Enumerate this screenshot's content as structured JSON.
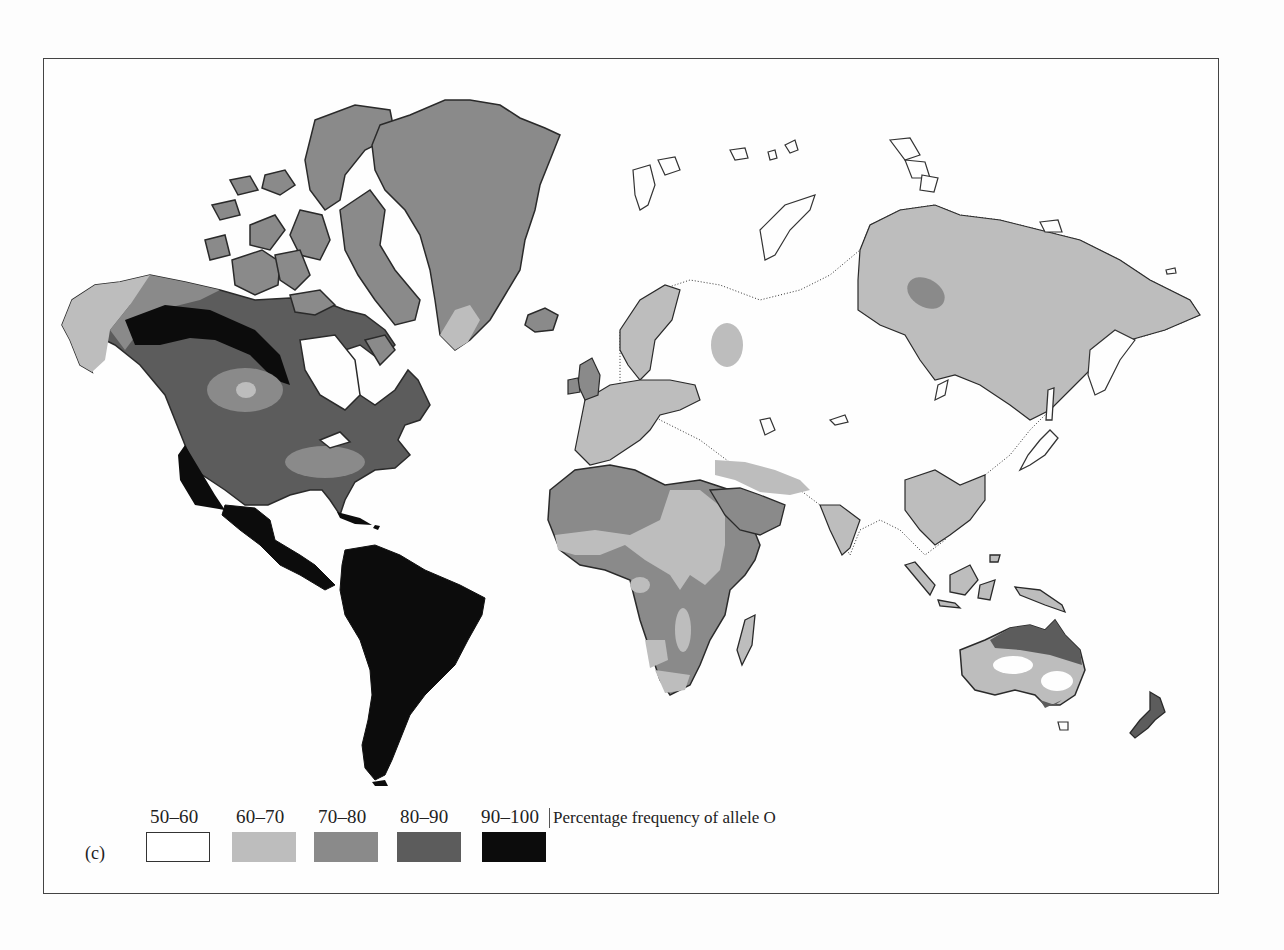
{
  "figure": {
    "panel_label": "(c)",
    "title": "Percentage frequency of allele O"
  },
  "legend": {
    "items": [
      {
        "label": "50–60",
        "range": [
          50,
          60
        ],
        "color": "#ffffff",
        "bordered": true
      },
      {
        "label": "60–70",
        "range": [
          60,
          70
        ],
        "color": "#bdbdbd",
        "bordered": false
      },
      {
        "label": "70–80",
        "range": [
          70,
          80
        ],
        "color": "#8a8a8a",
        "bordered": false
      },
      {
        "label": "80–90",
        "range": [
          80,
          90
        ],
        "color": "#5c5c5c",
        "bordered": false
      },
      {
        "label": "90–100",
        "range": [
          90,
          100
        ],
        "color": "#0c0c0c",
        "bordered": false
      }
    ]
  },
  "map": {
    "type": "choropleth-world",
    "regions": [
      {
        "name": "South America",
        "class": "90–100"
      },
      {
        "name": "Central America & Mexico",
        "class": "90–100"
      },
      {
        "name": "Western Canada / Alaska interior band",
        "class": "90–100"
      },
      {
        "name": "North America (most)",
        "class": "80–90"
      },
      {
        "name": "Canadian Arctic islands",
        "class": "70–80"
      },
      {
        "name": "Greenland",
        "class": "70–80"
      },
      {
        "name": "Southern Greenland tip",
        "class": "60–70"
      },
      {
        "name": "Alaska west coast",
        "class": "60–70"
      },
      {
        "name": "Iceland",
        "class": "70–80"
      },
      {
        "name": "Western Europe",
        "class": "60–70"
      },
      {
        "name": "Eastern Europe / Central Asia / Northern China",
        "class": "50–60"
      },
      {
        "name": "Siberia",
        "class": "60–70"
      },
      {
        "name": "Central Siberia patch",
        "class": "70–80"
      },
      {
        "name": "Arabian Peninsula",
        "class": "70–80"
      },
      {
        "name": "North-west Africa",
        "class": "70–80"
      },
      {
        "name": "Sahel / East Africa",
        "class": "60–70"
      },
      {
        "name": "Central & Southern Africa",
        "class": "70–80"
      },
      {
        "name": "South & Southeast Asia",
        "class": "60–70"
      },
      {
        "name": "Northern Australia",
        "class": "70–80"
      },
      {
        "name": "Central Australia patches",
        "class": "50–60"
      },
      {
        "name": "New Zealand",
        "class": "70–80"
      }
    ]
  }
}
